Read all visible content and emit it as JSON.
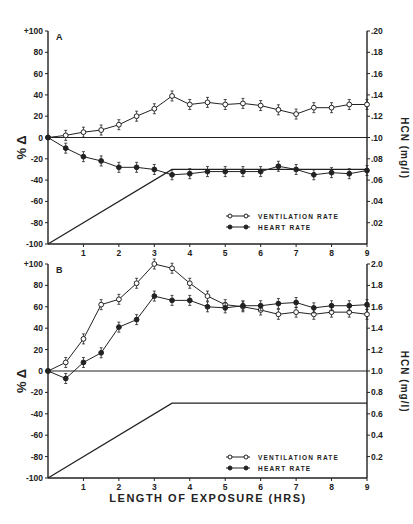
{
  "chart_data": [
    {
      "type": "line",
      "panel": "A",
      "title": "",
      "xlabel": "",
      "ylabel": "% Δ",
      "y2label": "HCN (mg/l)",
      "x": [
        0,
        0.5,
        1,
        1.5,
        2,
        2.5,
        3,
        3.5,
        4,
        4.5,
        5,
        5.5,
        6,
        6.5,
        7,
        7.5,
        8,
        8.5,
        9
      ],
      "xticks": [
        "1",
        "2",
        "3",
        "4",
        "5",
        "6",
        "7",
        "8",
        "9"
      ],
      "xlim": [
        0,
        9
      ],
      "ylim": [
        -100,
        100
      ],
      "yticks": [
        "+100",
        "80",
        "60",
        "40",
        "20",
        "0",
        "-20",
        "-40",
        "-60",
        "-80",
        "-100"
      ],
      "y2lim": [
        0,
        0.2
      ],
      "y2ticks": [
        ".20",
        ".18",
        ".16",
        ".14",
        ".12",
        ".10",
        ".08",
        ".06",
        ".04",
        ".02"
      ],
      "series": [
        {
          "name": "VENTILATION RATE",
          "marker": "open-circle",
          "values": [
            0,
            2,
            5,
            7,
            12,
            20,
            27,
            39,
            31,
            33,
            31,
            32,
            30,
            26,
            22,
            28,
            28,
            31,
            31
          ]
        },
        {
          "name": "HEART RATE",
          "marker": "filled-circle",
          "values": [
            0,
            -10,
            -18,
            -22,
            -28,
            -28,
            -30,
            -35,
            -34,
            -32,
            -32,
            -32,
            -32,
            -27,
            -30,
            -35,
            -33,
            -34,
            -31
          ]
        },
        {
          "name": "HCN concentration",
          "marker": "none",
          "axis": "y2",
          "x": [
            0,
            3.5,
            9
          ],
          "values": [
            0,
            0.07,
            0.07
          ]
        }
      ],
      "legend": {
        "placement": "bottom-right",
        "entries": [
          "VENTILATION RATE",
          "HEART RATE"
        ]
      }
    },
    {
      "type": "line",
      "panel": "B",
      "title": "",
      "xlabel": "LENGTH OF EXPOSURE (HRS)",
      "ylabel": "% Δ",
      "y2label": "HCN (mg/l)",
      "x": [
        0,
        0.5,
        1,
        1.5,
        2,
        2.5,
        3,
        3.5,
        4,
        4.5,
        5,
        5.5,
        6,
        6.5,
        7,
        7.5,
        8,
        8.5,
        9
      ],
      "xticks": [
        "1",
        "2",
        "3",
        "4",
        "5",
        "6",
        "7",
        "8",
        "9"
      ],
      "xlim": [
        0,
        9
      ],
      "ylim": [
        -100,
        100
      ],
      "yticks": [
        "+100",
        "80",
        "60",
        "40",
        "20",
        "0",
        "-20",
        "-40",
        "-60",
        "-80",
        "-100"
      ],
      "y2lim": [
        0,
        2.0
      ],
      "y2ticks": [
        "2.0",
        "1.8",
        "1.6",
        "1.4",
        "1.2",
        "1.0",
        "0.8",
        "0.6",
        "0.4",
        "0.2"
      ],
      "series": [
        {
          "name": "VENTILATION RATE",
          "marker": "open-circle",
          "values": [
            0,
            8,
            30,
            62,
            67,
            82,
            100,
            96,
            82,
            70,
            62,
            60,
            57,
            53,
            55,
            53,
            55,
            55,
            53
          ]
        },
        {
          "name": "HEART RATE",
          "marker": "filled-circle",
          "values": [
            0,
            -7,
            8,
            17,
            41,
            48,
            70,
            66,
            66,
            60,
            59,
            61,
            61,
            63,
            64,
            59,
            61,
            61,
            62
          ]
        },
        {
          "name": "HCN concentration",
          "marker": "none",
          "axis": "y2",
          "x": [
            0,
            3.5,
            9
          ],
          "values": [
            0,
            0.7,
            0.7
          ]
        }
      ],
      "legend": {
        "placement": "bottom-right",
        "entries": [
          "VENTILATION RATE",
          "HEART RATE"
        ]
      }
    }
  ],
  "labels": {
    "panelA": "A",
    "panelB": "B",
    "ylabel": "% Δ",
    "y2label": "HCN (mg/l)",
    "xlabel": "LENGTH OF EXPOSURE (HRS)",
    "legend_vent": "VENTILATION RATE",
    "legend_heart": "HEART RATE"
  }
}
